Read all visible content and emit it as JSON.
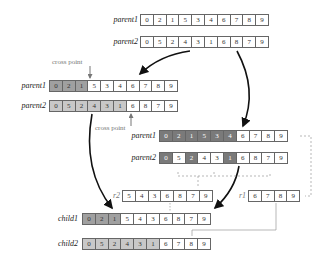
{
  "top": {
    "parent1": {
      "label": "parent1",
      "values": [
        "0",
        "2",
        "1",
        "5",
        "3",
        "4",
        "6",
        "7",
        "8",
        "9"
      ]
    },
    "parent2": {
      "label": "parent2",
      "values": [
        "0",
        "5",
        "2",
        "4",
        "3",
        "1",
        "6",
        "8",
        "7",
        "9"
      ]
    }
  },
  "crossover": {
    "cross_point_label_1": "cross point",
    "cross_point_label_2": "cross point",
    "parent1": {
      "label": "parent1",
      "values": [
        "0",
        "2",
        "1",
        "5",
        "3",
        "4",
        "6",
        "7",
        "8",
        "9"
      ]
    },
    "parent2": {
      "label": "parent2",
      "values": [
        "0",
        "5",
        "2",
        "4",
        "3",
        "1",
        "6",
        "8",
        "7",
        "9"
      ]
    }
  },
  "marked": {
    "parent1": {
      "label": "parent1",
      "values": [
        "0",
        "2",
        "1",
        "5",
        "3",
        "4",
        "6",
        "7",
        "8",
        "9"
      ]
    },
    "parent2": {
      "label": "parent2",
      "values": [
        "0",
        "5",
        "2",
        "4",
        "3",
        "1",
        "6",
        "8",
        "7",
        "9"
      ]
    }
  },
  "remainders": {
    "r2": {
      "label": "r2",
      "values": [
        "5",
        "4",
        "3",
        "6",
        "8",
        "7",
        "9"
      ]
    },
    "r1": {
      "label": "r1",
      "values": [
        "6",
        "7",
        "8",
        "9"
      ]
    }
  },
  "children": {
    "child1": {
      "label": "child1",
      "values": [
        "0",
        "2",
        "1",
        "5",
        "4",
        "3",
        "6",
        "8",
        "7",
        "9"
      ]
    },
    "child2": {
      "label": "child2",
      "values": [
        "0",
        "5",
        "2",
        "4",
        "3",
        "1",
        "6",
        "7",
        "8",
        "9"
      ]
    }
  }
}
